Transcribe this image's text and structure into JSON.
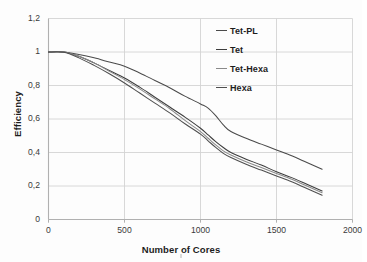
{
  "figure": {
    "background": "#fdfdfd",
    "grid_color": "#d4d4d4",
    "axis_color": "#b0b0b0"
  },
  "chart_data": {
    "type": "line",
    "title": "",
    "xlabel": "Number of Cores",
    "ylabel": "Efficiency",
    "xlim": [
      0,
      2000
    ],
    "ylim": [
      0,
      1.2
    ],
    "xticks": [
      0,
      500,
      1000,
      1500,
      2000
    ],
    "xtick_labels": [
      "0",
      "500",
      "1000",
      "1500",
      "2000"
    ],
    "yticks": [
      0,
      0.2,
      0.4,
      0.6,
      0.8,
      1.0,
      1.2
    ],
    "ytick_labels": [
      "0",
      "0,2",
      "0,4",
      "0,6",
      "0,8",
      "1",
      "1,2"
    ],
    "grid": true,
    "grid_axis": "both",
    "legend_position": "upper right inside",
    "decimal_separator": ",",
    "series": [
      {
        "name": "Tet-PL",
        "color": "#4a4a4a",
        "x": [
          0,
          100,
          200,
          300,
          400,
          500,
          600,
          700,
          800,
          900,
          1000,
          1050,
          1100,
          1150,
          1200,
          1300,
          1400,
          1500,
          1600,
          1700,
          1800
        ],
        "values": [
          1.0,
          1.0,
          0.985,
          0.965,
          0.94,
          0.915,
          0.875,
          0.83,
          0.785,
          0.735,
          0.69,
          0.665,
          0.62,
          0.565,
          0.525,
          0.485,
          0.45,
          0.415,
          0.38,
          0.34,
          0.3
        ]
      },
      {
        "name": "Tet",
        "color": "#3d3d3d",
        "x": [
          0,
          100,
          200,
          300,
          400,
          500,
          600,
          700,
          800,
          900,
          1000,
          1050,
          1100,
          1150,
          1200,
          1300,
          1400,
          1500,
          1600,
          1700,
          1800
        ],
        "values": [
          1.0,
          1.0,
          0.975,
          0.935,
          0.89,
          0.845,
          0.79,
          0.73,
          0.67,
          0.61,
          0.545,
          0.505,
          0.465,
          0.43,
          0.4,
          0.36,
          0.325,
          0.285,
          0.25,
          0.21,
          0.17
        ]
      },
      {
        "name": "Tet-Hexa",
        "color": "#8a8a8a",
        "x": [
          0,
          100,
          200,
          300,
          400,
          500,
          600,
          700,
          800,
          900,
          1000,
          1050,
          1100,
          1150,
          1200,
          1300,
          1400,
          1500,
          1600,
          1700,
          1800
        ],
        "values": [
          1.0,
          1.0,
          0.975,
          0.935,
          0.885,
          0.835,
          0.78,
          0.72,
          0.66,
          0.59,
          0.525,
          0.485,
          0.445,
          0.41,
          0.385,
          0.345,
          0.31,
          0.275,
          0.24,
          0.2,
          0.16
        ]
      },
      {
        "name": "Hexa",
        "color": "#4f4f4f",
        "x": [
          0,
          100,
          200,
          300,
          400,
          500,
          600,
          700,
          800,
          900,
          1000,
          1050,
          1100,
          1150,
          1200,
          1300,
          1400,
          1500,
          1600,
          1700,
          1800
        ],
        "values": [
          1.0,
          0.998,
          0.965,
          0.92,
          0.87,
          0.815,
          0.755,
          0.695,
          0.635,
          0.57,
          0.51,
          0.47,
          0.43,
          0.395,
          0.37,
          0.33,
          0.295,
          0.26,
          0.225,
          0.185,
          0.145
        ]
      }
    ]
  }
}
